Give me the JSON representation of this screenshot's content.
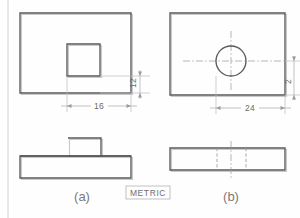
{
  "sheet": {
    "standard_label": "METRIC",
    "width": 300,
    "height": 218,
    "line_color": "#58585a",
    "dim_color": "#9a9a9e"
  },
  "views": {
    "a": {
      "caption": "(a)",
      "top_view": {
        "name": "rectangular-plate-with-square-hole",
        "x": 20,
        "y": 13,
        "w": 111,
        "h": 80,
        "feature": {
          "type": "square-hole",
          "x": 67,
          "y": 44,
          "w": 33,
          "h": 32
        }
      },
      "front_view": {
        "name": "plate-with-raised-boss",
        "base": {
          "x": 20,
          "y": 156,
          "w": 111,
          "h": 22
        },
        "boss": {
          "x": 68,
          "y": 138,
          "w": 33,
          "h": 18
        }
      },
      "dimensions": [
        {
          "name": "vertical-dim-12",
          "value": "12",
          "orientation": "vertical"
        },
        {
          "name": "horizontal-dim-16",
          "value": "16",
          "orientation": "horizontal"
        }
      ]
    },
    "b": {
      "caption": "(b)",
      "top_view": {
        "name": "rectangular-plate-with-round-hole",
        "x": 170,
        "y": 13,
        "w": 115,
        "h": 82,
        "feature": {
          "type": "circular-hole",
          "cx": 231,
          "cy": 61,
          "r": 15
        }
      },
      "front_view": {
        "name": "flat-plate-with-hidden-hole",
        "base": {
          "x": 170,
          "y": 148,
          "w": 115,
          "h": 22
        }
      },
      "dimensions": [
        {
          "name": "horizontal-dim-24",
          "value": "24",
          "orientation": "horizontal"
        },
        {
          "name": "vertical-dim-2",
          "value": "2",
          "orientation": "vertical"
        }
      ]
    }
  }
}
